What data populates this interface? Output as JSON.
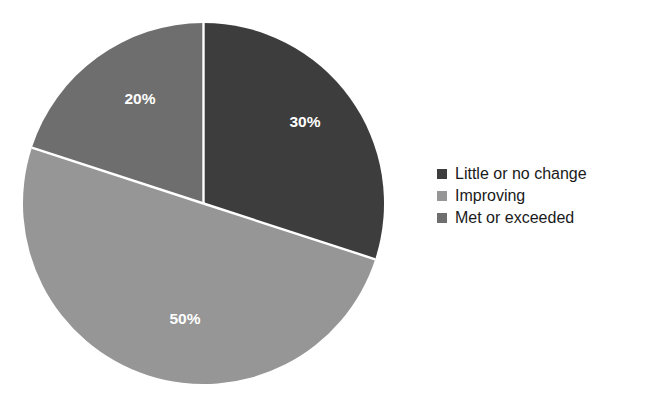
{
  "chart_data": {
    "type": "pie",
    "title": "",
    "categories": [
      "Little or no change",
      "Improving",
      "Met or exceeded"
    ],
    "values": [
      30,
      50,
      20
    ],
    "value_labels": [
      "30%",
      "50%",
      "20%"
    ],
    "colors": [
      "#3d3d3d",
      "#969696",
      "#6e6e6e"
    ],
    "label_text_color": "#ffffff",
    "slice_divider_color": "#ffffff",
    "background": "#ffffff",
    "start_angle_deg": 0,
    "direction": "clockwise",
    "legend_position": "right",
    "grid": false,
    "xlabel": "",
    "ylabel": "",
    "slices": [
      {
        "name": "Little or no change",
        "value": 30,
        "label": "30%",
        "color": "#3d3d3d",
        "start_deg": 0,
        "end_deg": 108
      },
      {
        "name": "Improving",
        "value": 50,
        "label": "50%",
        "color": "#969696",
        "start_deg": 108,
        "end_deg": 288
      },
      {
        "name": "Met or exceeded",
        "value": 20,
        "label": "20%",
        "color": "#6e6e6e",
        "start_deg": 288,
        "end_deg": 360
      }
    ]
  },
  "legend": {
    "items": [
      {
        "label": "Little or no change",
        "color": "#3d3d3d"
      },
      {
        "label": "Improving",
        "color": "#969696"
      },
      {
        "label": "Met or exceeded",
        "color": "#6e6e6e"
      }
    ]
  }
}
